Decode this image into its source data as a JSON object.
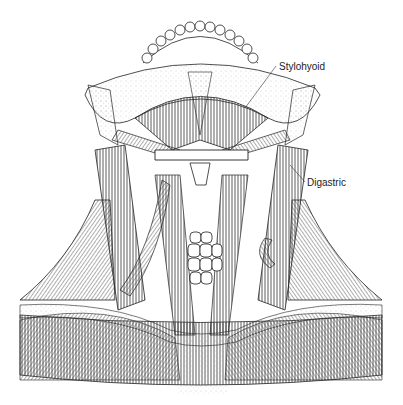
{
  "figure": {
    "labels": [
      {
        "id": "stylohyoid",
        "text": "Stylohyoid"
      },
      {
        "id": "digastric",
        "text": "Digastric"
      }
    ]
  },
  "colors": {
    "ink": "#222222",
    "background": "#ffffff",
    "stipple": "#9a9a9a"
  }
}
